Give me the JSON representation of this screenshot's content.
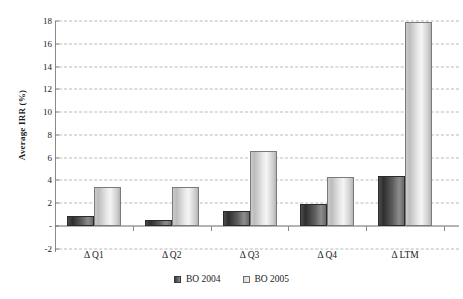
{
  "chart_data": {
    "type": "bar",
    "title": "",
    "subtitle": "",
    "xlabel": "",
    "ylabel": "Average IRR (%)",
    "categories": [
      "Δ Q1",
      "Δ Q2",
      "Δ Q3",
      "Δ Q4",
      "Δ LTM"
    ],
    "series": [
      {
        "name": "BO 2004",
        "values": [
          0.85,
          0.5,
          1.3,
          1.95,
          4.4
        ],
        "color": "#4a4a4a"
      },
      {
        "name": "BO 2005",
        "values": [
          3.45,
          3.45,
          6.6,
          4.3,
          17.9
        ],
        "color": "#dcdcdc"
      }
    ],
    "ylim": [
      -2,
      18
    ],
    "ytick_values": [
      18,
      16,
      14,
      12,
      10,
      8,
      6,
      4,
      2,
      0,
      -2
    ],
    "ytick_labels": [
      "18",
      "16",
      "14",
      "12",
      "10",
      "8",
      "6",
      "4",
      "2",
      "-",
      "-2"
    ],
    "grid": true,
    "grid_style": "dashed",
    "legend_position": "bottom",
    "legend": [
      "BO 2004",
      "BO 2005"
    ],
    "annotations": []
  },
  "axis": {
    "y_title": "Average IRR (%)"
  },
  "colors": {
    "bar_2004": "#4a4a4a",
    "bar_2005": "#dcdcdc",
    "gridline": "#b9b9b9",
    "axis": "#8a8a8a",
    "background": "#ffffff",
    "text": "#1a1a1a"
  }
}
